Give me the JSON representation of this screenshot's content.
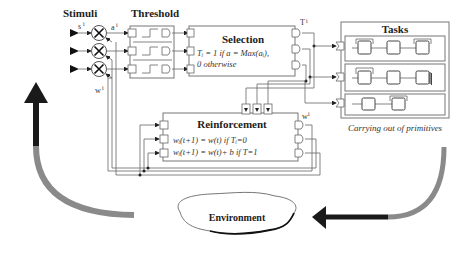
{
  "diagram": {
    "labels": {
      "stimuli": "Stimuli",
      "threshold": "Threshold",
      "selection": "Selection",
      "tasks": "Tasks",
      "reinforcement": "Reinforcement",
      "environment": "Environment",
      "carrying_out": "Carrying out of primitives",
      "s_i": "s",
      "s_sup": "i",
      "a_i": "a",
      "a_sup": "i",
      "w_i": "w",
      "w_sup": "i",
      "T_i": "T",
      "T_sup": "i",
      "W_i_reinf": "w",
      "W_i_reinf_sup": "i"
    },
    "selection_rule": {
      "line1": "Tᵢ = 1 if a = Max(aᵢ),",
      "line2": "0 otherwise"
    },
    "reinforcement_rule": {
      "line1": "wᵢ(t+1) = w(t) if Tᵢ=0",
      "line2": "wᵢ(t+1) = w(t)+ b if T=1"
    },
    "stimuli_count": 3,
    "task_rows": [
      {
        "blocks": 3
      },
      {
        "blocks": 3
      },
      {
        "blocks": 2
      }
    ],
    "colors": {
      "arrow_dark": "#1a1a1a",
      "arrow_light": "#8a8a8a",
      "line": "#666666"
    }
  }
}
